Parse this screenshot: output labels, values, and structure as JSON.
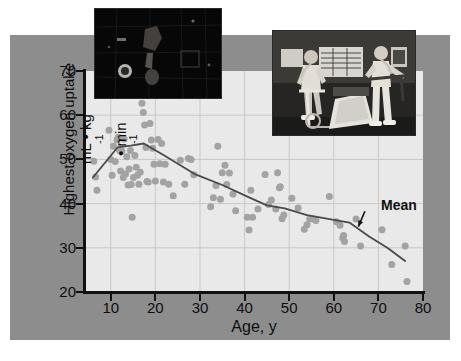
{
  "figure": {
    "background_color": "#8d8d8d",
    "plot_background_color": "#e9e9e9",
    "point_color": "#a3a3a3",
    "line_color": "#4a4a4a",
    "axis_color": "#111111"
  },
  "axes": {
    "y_title_line1": "Highest oxygen uptake",
    "y_title_line2_prefix": "mL • kg",
    "y_title_line2_sup1": "-1",
    "y_title_line2_mid": " • min",
    "y_title_line2_sup2": "-1",
    "x_title": "Age, y",
    "y_ticks": [
      20,
      30,
      40,
      50,
      60,
      70
    ],
    "x_ticks": [
      10,
      20,
      30,
      40,
      50,
      60,
      70,
      80
    ]
  },
  "annotations": {
    "mean_label": "Mean"
  },
  "insets": {
    "left": {
      "name": "dark-scene-photo",
      "alt": "dark photograph"
    },
    "right": {
      "name": "exercise-lab-photo",
      "alt": "two people exercising on treadmill and cycle ergometer in a lab"
    }
  },
  "chart_data": {
    "type": "scatter",
    "title": "",
    "subtitle": "",
    "xlabel": "Age, y",
    "ylabel": "Highest oxygen uptake mL • kg-1 • min-1",
    "xlim": [
      4,
      80
    ],
    "ylim": [
      20,
      70
    ],
    "xticks": [
      10,
      20,
      30,
      40,
      50,
      60,
      70,
      80
    ],
    "yticks": [
      20,
      30,
      40,
      50,
      60,
      70
    ],
    "grid": true,
    "legend": "none",
    "annotations": [
      {
        "text": "Mean",
        "x": 69,
        "y": 38.5,
        "arrow_to_x": 65.5,
        "arrow_to_y": 34.8
      }
    ],
    "series": [
      {
        "name": "Individuals",
        "type": "scatter",
        "marker": "circle",
        "color": "#a3a3a3",
        "points": [
          [
            6.2,
            49.6
          ],
          [
            6.6,
            46.0
          ],
          [
            6.9,
            43.0
          ],
          [
            9.6,
            56.6
          ],
          [
            10.0,
            50.0
          ],
          [
            10.3,
            46.4
          ],
          [
            10.6,
            53.0
          ],
          [
            11.0,
            49.5
          ],
          [
            11.4,
            54.4
          ],
          [
            11.7,
            55.0
          ],
          [
            12.0,
            52.0
          ],
          [
            12.2,
            47.4
          ],
          [
            12.5,
            51.9
          ],
          [
            12.8,
            45.9
          ],
          [
            13.0,
            54.6
          ],
          [
            13.3,
            46.7
          ],
          [
            13.6,
            50.6
          ],
          [
            13.9,
            44.2
          ],
          [
            14.1,
            47.8
          ],
          [
            14.4,
            52.0
          ],
          [
            14.6,
            44.3
          ],
          [
            14.8,
            36.9
          ],
          [
            15.1,
            45.9
          ],
          [
            15.4,
            50.9
          ],
          [
            15.7,
            48.2
          ],
          [
            16.0,
            46.4
          ],
          [
            16.3,
            44.4
          ],
          [
            16.6,
            47.1
          ],
          [
            17.0,
            62.7
          ],
          [
            17.3,
            60.6
          ],
          [
            17.6,
            57.8
          ],
          [
            17.9,
            52.7
          ],
          [
            18.1,
            45.0
          ],
          [
            18.4,
            44.9
          ],
          [
            18.8,
            58.1
          ],
          [
            19.1,
            54.4
          ],
          [
            19.4,
            52.5
          ],
          [
            19.7,
            48.9
          ],
          [
            20.0,
            45.1
          ],
          [
            20.6,
            54.5
          ],
          [
            21.0,
            49.0
          ],
          [
            21.4,
            53.6
          ],
          [
            21.8,
            44.9
          ],
          [
            22.2,
            48.9
          ],
          [
            23.0,
            44.4
          ],
          [
            24.0,
            41.8
          ],
          [
            25.6,
            49.8
          ],
          [
            26.6,
            44.4
          ],
          [
            27.4,
            50.2
          ],
          [
            28.0,
            50.0
          ],
          [
            28.6,
            46.5
          ],
          [
            32.4,
            39.3
          ],
          [
            33.0,
            41.3
          ],
          [
            33.6,
            44.1
          ],
          [
            34.0,
            53.0
          ],
          [
            34.6,
            41.0
          ],
          [
            35.0,
            47.0
          ],
          [
            35.6,
            48.7
          ],
          [
            36.0,
            44.3
          ],
          [
            36.6,
            46.9
          ],
          [
            37.4,
            42.2
          ],
          [
            38.0,
            38.4
          ],
          [
            40.6,
            36.9
          ],
          [
            41.0,
            34.0
          ],
          [
            41.4,
            43.0
          ],
          [
            41.8,
            36.9
          ],
          [
            43.0,
            38.8
          ],
          [
            44.6,
            46.6
          ],
          [
            45.4,
            39.8
          ],
          [
            46.0,
            40.8
          ],
          [
            47.0,
            38.8
          ],
          [
            47.4,
            47.0
          ],
          [
            47.8,
            43.6
          ],
          [
            48.0,
            43.8
          ],
          [
            48.4,
            36.6
          ],
          [
            48.8,
            37.4
          ],
          [
            50.6,
            41.2
          ],
          [
            52.0,
            39.0
          ],
          [
            53.4,
            34.2
          ],
          [
            54.0,
            35.2
          ],
          [
            54.6,
            36.5
          ],
          [
            55.4,
            36.5
          ],
          [
            56.0,
            36.2
          ],
          [
            59.0,
            41.6
          ],
          [
            60.6,
            35.9
          ],
          [
            61.4,
            35.1
          ],
          [
            62.0,
            32.2
          ],
          [
            62.2,
            32.8
          ],
          [
            62.4,
            31.4
          ],
          [
            65.0,
            36.5
          ],
          [
            66.0,
            30.4
          ],
          [
            70.8,
            34.1
          ],
          [
            73.0,
            26.2
          ],
          [
            76.0,
            30.4
          ],
          [
            76.4,
            22.4
          ]
        ]
      },
      {
        "name": "Mean",
        "type": "line",
        "color": "#4a4a4a",
        "points": [
          [
            6.0,
            45.9
          ],
          [
            11.5,
            52.7
          ],
          [
            14.5,
            53.1
          ],
          [
            17.4,
            53.6
          ],
          [
            22.0,
            50.9
          ],
          [
            29.0,
            46.6
          ],
          [
            35.0,
            44.2
          ],
          [
            41.0,
            41.4
          ],
          [
            45.0,
            39.6
          ],
          [
            49.0,
            38.9
          ],
          [
            54.0,
            37.4
          ],
          [
            60.0,
            36.3
          ],
          [
            63.5,
            35.7
          ],
          [
            68.0,
            32.5
          ],
          [
            72.0,
            30.0
          ],
          [
            76.0,
            27.0
          ]
        ]
      }
    ]
  }
}
